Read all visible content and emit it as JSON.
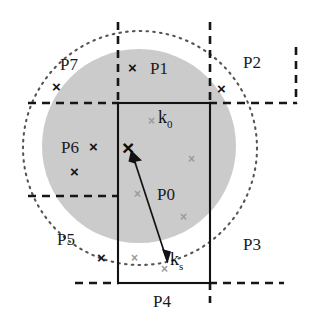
{
  "figure": {
    "background_color": "#ffffff",
    "shapes": {
      "filled_disc": {
        "name": "grey-disc",
        "cx": 139,
        "cy": 146,
        "r": 97,
        "fill": "#cccccc"
      },
      "dotted_circle": {
        "name": "dotted-circle",
        "cx": 140,
        "cy": 148,
        "r": 117,
        "stroke": "#4d4d4d",
        "style": "dotted"
      },
      "solid_rectangle": {
        "name": "solid-rectangle",
        "x": 118,
        "y": 103,
        "width": 92,
        "height": 180,
        "stroke": "#111111",
        "style": "solid"
      }
    },
    "dashed_lines": [
      {
        "name": "dashed-vertical-left",
        "x1": 118,
        "y1": 22,
        "x2": 118,
        "y2": 103
      },
      {
        "name": "dashed-vertical-right",
        "x1": 210,
        "y1": 22,
        "x2": 210,
        "y2": 103
      },
      {
        "name": "dashed-horizontal-top-left",
        "x1": 28,
        "y1": 103,
        "x2": 118,
        "y2": 103
      },
      {
        "name": "dashed-horizontal-top-right",
        "x1": 210,
        "y1": 103,
        "x2": 296,
        "y2": 103
      },
      {
        "name": "dashed-vertical-far-right",
        "x1": 296,
        "y1": 48,
        "x2": 296,
        "y2": 103
      },
      {
        "name": "dashed-horizontal-mid-left",
        "x1": 28,
        "y1": 196,
        "x2": 118,
        "y2": 196
      },
      {
        "name": "dashed-horizontal-bottom-left",
        "x1": 75,
        "y1": 283,
        "x2": 118,
        "y2": 283
      },
      {
        "name": "dashed-horizontal-bottom-right",
        "x1": 210,
        "y1": 283,
        "x2": 284,
        "y2": 283
      },
      {
        "name": "dashed-vertical-bottom",
        "x1": 210,
        "y1": 283,
        "x2": 210,
        "y2": 302
      }
    ],
    "arrow": {
      "name": "ks-to-k0-arrow",
      "from_x": 168,
      "from_y": 263,
      "to_x": 131,
      "to_y": 150,
      "stroke": "#111111",
      "double_headed": true
    }
  },
  "regions": [
    {
      "id": "P7",
      "label": "P7",
      "x": 60,
      "y": 56
    },
    {
      "id": "P1",
      "label": "P1",
      "x": 150,
      "y": 60
    },
    {
      "id": "P2",
      "label": "P2",
      "x": 243,
      "y": 54
    },
    {
      "id": "P6",
      "label": "P6",
      "x": 61,
      "y": 139
    },
    {
      "id": "P0",
      "label": "P0",
      "x": 157,
      "y": 186
    },
    {
      "id": "P5",
      "label": "P5",
      "x": 57,
      "y": 231
    },
    {
      "id": "P3",
      "label": "P3",
      "x": 243,
      "y": 236
    },
    {
      "id": "P4",
      "label": "P4",
      "x": 153,
      "y": 293
    }
  ],
  "vector_labels": [
    {
      "id": "k0",
      "base": "k",
      "sub": "0",
      "x": 158,
      "y": 113
    },
    {
      "id": "ks",
      "base": "k",
      "sub": "s",
      "x": 167,
      "y": 255
    }
  ],
  "marks": {
    "center_mark": {
      "name": "k0-center-mark",
      "glyph": "×",
      "x": 123,
      "y": 140,
      "color": "#0d0d0d"
    },
    "bold_marks": [
      {
        "name": "mark-p7",
        "glyph": "×",
        "x": 52,
        "y": 79
      },
      {
        "name": "mark-p1",
        "glyph": "×",
        "x": 128,
        "y": 60
      },
      {
        "name": "mark-p2",
        "glyph": "×",
        "x": 217,
        "y": 81
      },
      {
        "name": "mark-p6-a",
        "glyph": "×",
        "x": 89,
        "y": 139
      },
      {
        "name": "mark-p6-b",
        "glyph": "×",
        "x": 70,
        "y": 164
      },
      {
        "name": "mark-p5",
        "glyph": "×",
        "x": 97,
        "y": 250
      }
    ],
    "grey_marks": [
      {
        "name": "grey-mark-k0",
        "glyph": "×",
        "x": 148,
        "y": 115
      },
      {
        "name": "grey-mark-right-upper",
        "glyph": "×",
        "x": 188,
        "y": 153
      },
      {
        "name": "grey-mark-left-mid",
        "glyph": "×",
        "x": 134,
        "y": 188
      },
      {
        "name": "grey-mark-right-lower",
        "glyph": "×",
        "x": 180,
        "y": 211
      },
      {
        "name": "grey-mark-bottom-left",
        "glyph": "×",
        "x": 131,
        "y": 252
      },
      {
        "name": "grey-mark-ks",
        "glyph": "×",
        "x": 161,
        "y": 263
      }
    ]
  }
}
